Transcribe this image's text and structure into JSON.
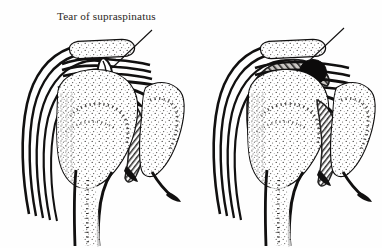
{
  "figure": {
    "background_color": "#ffffff",
    "ink_color": "#111010",
    "text_color": "#2a2724",
    "shading_color": "#6d6a67",
    "panel_count": 2
  },
  "panels": [
    {
      "id": "left",
      "label": "Tear of supraspinatus",
      "finding": "tear",
      "finding_icon": "tendon-tear-gap",
      "leader_line": {
        "from_x": 152,
        "from_y": 30,
        "to_x": 112,
        "to_y": 68
      },
      "structures": [
        "deltoid-muscle-fibers",
        "acromion",
        "supraspinatus-tendon",
        "subacromial-bursa",
        "humeral-head",
        "humeral-shaft",
        "glenoid",
        "scapula",
        "joint-capsule"
      ]
    },
    {
      "id": "right",
      "label": "Area of calcification",
      "finding": "calcification",
      "finding_icon": "calcific-deposit-nodule",
      "leader_line": {
        "from_x": 344,
        "from_y": 28,
        "to_x": 308,
        "to_y": 62
      },
      "structures": [
        "deltoid-muscle-fibers",
        "acromion",
        "supraspinatus-tendon",
        "inflamed-subacromial-bursa",
        "humeral-head",
        "humeral-shaft",
        "glenoid",
        "scapula",
        "joint-capsule"
      ]
    }
  ]
}
